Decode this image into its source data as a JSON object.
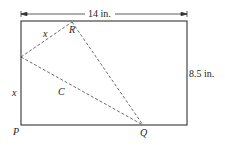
{
  "diagram": {
    "width_label": "14 in.",
    "height_label": "8.5 in.",
    "points": {
      "P": "P",
      "Q": "Q",
      "R": "R"
    },
    "segment_labels": {
      "x_top": "x",
      "x_left": "x",
      "crease": "C"
    },
    "colors": {
      "line": "#333333",
      "background": "#ffffff"
    }
  }
}
